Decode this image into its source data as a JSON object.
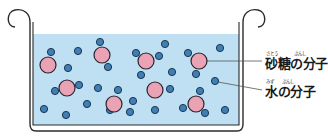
{
  "diagram": {
    "title": "",
    "colors": {
      "water_fill": "#bfe0f2",
      "pot_stroke": "#2b2b2b",
      "sugar_fill": "#e9a3b4",
      "sugar_stroke": "#2a2430",
      "water_molecule_fill": "#3f7fb5",
      "water_molecule_stroke": "#1d3550",
      "leader_line": "#555555"
    },
    "labels": [
      {
        "id": "sugar",
        "text": "砂糖の分子",
        "furigana": [
          {
            "reading": "さとう",
            "over": "砂糖"
          },
          {
            "reading": "ぶんし",
            "over": "分子"
          }
        ]
      },
      {
        "id": "water",
        "text": "水の分子",
        "furigana": [
          {
            "reading": "みず",
            "over": "水"
          },
          {
            "reading": "ぶんし",
            "over": "分子"
          }
        ]
      }
    ],
    "sugar_molecules": [
      {
        "x": 48,
        "y": 65
      },
      {
        "x": 102,
        "y": 55
      },
      {
        "x": 146,
        "y": 61
      },
      {
        "x": 199,
        "y": 61
      },
      {
        "x": 67,
        "y": 88
      },
      {
        "x": 155,
        "y": 90
      },
      {
        "x": 114,
        "y": 104
      },
      {
        "x": 196,
        "y": 104
      }
    ],
    "water_molecules": [
      {
        "x": 51,
        "y": 52
      },
      {
        "x": 78,
        "y": 51
      },
      {
        "x": 100,
        "y": 42
      },
      {
        "x": 108,
        "y": 67
      },
      {
        "x": 68,
        "y": 68
      },
      {
        "x": 165,
        "y": 44
      },
      {
        "x": 220,
        "y": 48
      },
      {
        "x": 136,
        "y": 53
      },
      {
        "x": 159,
        "y": 56
      },
      {
        "x": 141,
        "y": 75
      },
      {
        "x": 172,
        "y": 72
      },
      {
        "x": 188,
        "y": 53
      },
      {
        "x": 196,
        "y": 74
      },
      {
        "x": 215,
        "y": 81
      },
      {
        "x": 55,
        "y": 91
      },
      {
        "x": 79,
        "y": 85
      },
      {
        "x": 98,
        "y": 88
      },
      {
        "x": 87,
        "y": 104
      },
      {
        "x": 44,
        "y": 109
      },
      {
        "x": 66,
        "y": 115
      },
      {
        "x": 118,
        "y": 90
      },
      {
        "x": 133,
        "y": 101
      },
      {
        "x": 110,
        "y": 110
      },
      {
        "x": 130,
        "y": 112
      },
      {
        "x": 170,
        "y": 89
      },
      {
        "x": 155,
        "y": 110
      },
      {
        "x": 200,
        "y": 91
      },
      {
        "x": 183,
        "y": 108
      },
      {
        "x": 205,
        "y": 113
      },
      {
        "x": 225,
        "y": 110
      }
    ],
    "leader_lines": [
      {
        "id": "sugar",
        "x1": 207,
        "y1": 61,
        "x2": 262,
        "y2": 61
      },
      {
        "id": "water",
        "x1": 218,
        "y1": 82,
        "x2": 262,
        "y2": 90
      }
    ]
  }
}
